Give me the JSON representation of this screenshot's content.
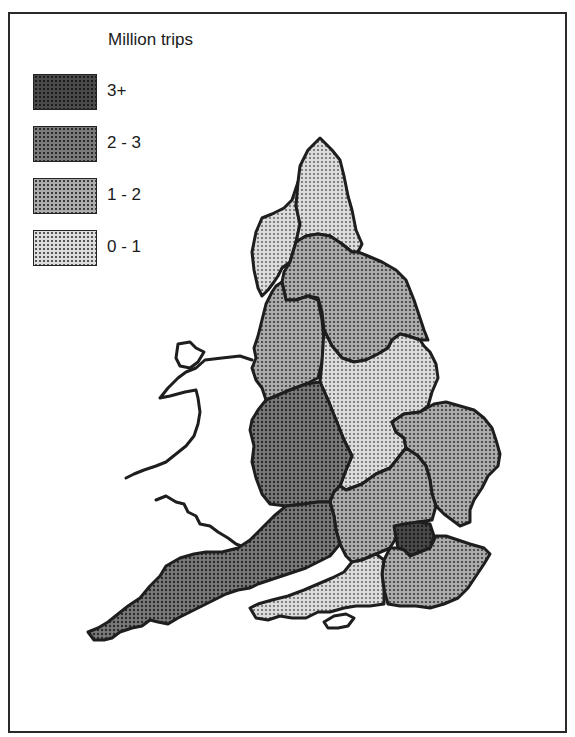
{
  "legend": {
    "title": "Million trips",
    "items": [
      {
        "label": "3+",
        "key": "c3",
        "color": "#4a4a4a"
      },
      {
        "label": "2 - 3",
        "key": "c2",
        "color": "#767676"
      },
      {
        "label": "1 - 2",
        "key": "c1",
        "color": "#a6a6a6"
      },
      {
        "label": "0 - 1",
        "key": "c0",
        "color": "#d6d6d6"
      }
    ]
  },
  "map": {
    "title": "England tourist regions — trips (million)",
    "regions": [
      {
        "name": "Cumbria",
        "band": "0 - 1"
      },
      {
        "name": "Northumbria",
        "band": "0 - 1"
      },
      {
        "name": "North West",
        "band": "1 - 2"
      },
      {
        "name": "Yorkshire & Humberside",
        "band": "1 - 2"
      },
      {
        "name": "Heart of England",
        "band": "2 - 3"
      },
      {
        "name": "East Midlands",
        "band": "0 - 1"
      },
      {
        "name": "East Anglia",
        "band": "1 - 2"
      },
      {
        "name": "Thames & Chilterns",
        "band": "1 - 2"
      },
      {
        "name": "London",
        "band": "3+"
      },
      {
        "name": "South East",
        "band": "1 - 2"
      },
      {
        "name": "Southern",
        "band": "0 - 1"
      },
      {
        "name": "West Country",
        "band": "2 - 3"
      },
      {
        "name": "Wales",
        "band": "not shaded"
      }
    ]
  }
}
